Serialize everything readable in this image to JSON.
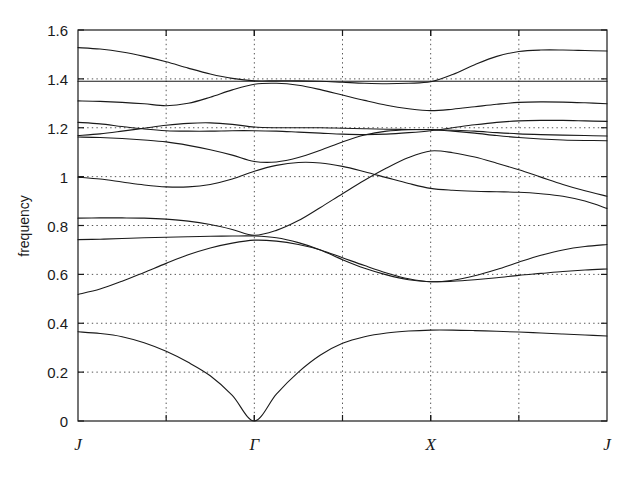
{
  "figure": {
    "kind": "phonon-band-structure-plot",
    "background_color": "#ffffff",
    "line_color": "#1a1a1a",
    "grid_color": "#555555"
  },
  "axes": {
    "ylabel": "frequency",
    "y_ticks": [
      "0",
      "0.2",
      "0.4",
      "0.6",
      "0.8",
      "1",
      "1.2",
      "1.4",
      "1.6"
    ],
    "x_ticks": [
      "J",
      "Γ",
      "X",
      "J"
    ]
  },
  "chart_data": {
    "type": "line",
    "title": "",
    "xlabel": "",
    "ylabel": "frequency",
    "xlim": [
      0,
      6
    ],
    "ylim": [
      0,
      1.6
    ],
    "grid": true,
    "legend": "none",
    "x_tick_labels": [
      "J",
      "Γ",
      "X",
      "J"
    ],
    "x_tick_values": [
      0,
      2,
      4,
      6
    ],
    "x_gridline_values": [
      1,
      2,
      3,
      4,
      5
    ],
    "y_tick_values": [
      0,
      0.2,
      0.4,
      0.6,
      0.8,
      1.0,
      1.2,
      1.4,
      1.6
    ],
    "x_sample": [
      0,
      0.25,
      0.5,
      0.75,
      1,
      1.25,
      1.5,
      1.75,
      2,
      2.25,
      2.5,
      2.75,
      3,
      3.25,
      3.5,
      3.75,
      4,
      4.25,
      4.5,
      4.75,
      5,
      5.25,
      5.5,
      5.75,
      6
    ],
    "series": [
      {
        "name": "band-1-acoustic",
        "values": [
          0.365,
          0.358,
          0.345,
          0.32,
          0.285,
          0.24,
          0.185,
          0.105,
          0.0,
          0.11,
          0.2,
          0.27,
          0.318,
          0.345,
          0.36,
          0.368,
          0.372,
          0.372,
          0.37,
          0.367,
          0.364,
          0.36,
          0.356,
          0.352,
          0.348
        ]
      },
      {
        "name": "band-2",
        "values": [
          0.518,
          0.54,
          0.572,
          0.608,
          0.645,
          0.68,
          0.708,
          0.728,
          0.74,
          0.736,
          0.722,
          0.7,
          0.668,
          0.636,
          0.606,
          0.582,
          0.57,
          0.576,
          0.594,
          0.62,
          0.65,
          0.678,
          0.7,
          0.714,
          0.722
        ]
      },
      {
        "name": "band-3",
        "values": [
          0.742,
          0.744,
          0.747,
          0.75,
          0.752,
          0.754,
          0.756,
          0.757,
          0.757,
          0.75,
          0.73,
          0.7,
          0.66,
          0.625,
          0.598,
          0.578,
          0.57,
          0.572,
          0.578,
          0.586,
          0.596,
          0.604,
          0.612,
          0.618,
          0.622
        ]
      },
      {
        "name": "band-4",
        "values": [
          0.83,
          0.831,
          0.831,
          0.83,
          0.826,
          0.818,
          0.804,
          0.784,
          0.76,
          0.78,
          0.82,
          0.874,
          0.93,
          0.985,
          1.035,
          1.078,
          1.105,
          1.098,
          1.08,
          1.055,
          1.028,
          0.998,
          0.968,
          0.942,
          0.92
        ]
      },
      {
        "name": "band-5",
        "values": [
          0.998,
          0.99,
          0.978,
          0.966,
          0.958,
          0.958,
          0.968,
          0.99,
          1.022,
          1.046,
          1.058,
          1.056,
          1.042,
          1.02,
          0.996,
          0.972,
          0.952,
          0.944,
          0.94,
          0.938,
          0.936,
          0.93,
          0.92,
          0.9,
          0.87
        ]
      },
      {
        "name": "band-6",
        "values": [
          1.162,
          1.16,
          1.156,
          1.15,
          1.142,
          1.128,
          1.11,
          1.088,
          1.062,
          1.06,
          1.078,
          1.108,
          1.142,
          1.17,
          1.186,
          1.192,
          1.193,
          1.19,
          1.186,
          1.18,
          1.175,
          1.172,
          1.17,
          1.168,
          1.166
        ]
      },
      {
        "name": "band-7",
        "values": [
          1.168,
          1.175,
          1.186,
          1.198,
          1.21,
          1.218,
          1.22,
          1.214,
          1.203,
          1.2,
          1.2,
          1.2,
          1.198,
          1.196,
          1.194,
          1.193,
          1.192,
          1.186,
          1.178,
          1.168,
          1.16,
          1.154,
          1.15,
          1.148,
          1.147
        ]
      },
      {
        "name": "band-8",
        "values": [
          1.222,
          1.216,
          1.205,
          1.195,
          1.188,
          1.186,
          1.186,
          1.188,
          1.188,
          1.186,
          1.182,
          1.178,
          1.174,
          1.172,
          1.174,
          1.18,
          1.188,
          1.2,
          1.212,
          1.222,
          1.228,
          1.23,
          1.23,
          1.228,
          1.226
        ]
      },
      {
        "name": "band-9",
        "values": [
          1.31,
          1.308,
          1.304,
          1.298,
          1.29,
          1.3,
          1.325,
          1.355,
          1.378,
          1.382,
          1.374,
          1.356,
          1.334,
          1.312,
          1.292,
          1.278,
          1.27,
          1.276,
          1.286,
          1.296,
          1.304,
          1.306,
          1.305,
          1.302,
          1.298
        ]
      },
      {
        "name": "band-10",
        "values": [
          1.528,
          1.522,
          1.51,
          1.492,
          1.47,
          1.444,
          1.42,
          1.402,
          1.392,
          1.392,
          1.392,
          1.39,
          1.386,
          1.382,
          1.38,
          1.382,
          1.388,
          1.418,
          1.458,
          1.492,
          1.512,
          1.518,
          1.518,
          1.516,
          1.514
        ]
      },
      {
        "name": "band-11",
        "values": [
          1.39,
          1.39,
          1.39,
          1.39,
          1.39,
          1.39,
          1.39,
          1.39,
          1.39,
          1.39,
          1.39,
          1.39,
          1.39,
          1.39,
          1.39,
          1.39,
          1.39,
          1.39,
          1.39,
          1.39,
          1.39,
          1.39,
          1.39,
          1.39,
          1.39
        ]
      }
    ]
  }
}
